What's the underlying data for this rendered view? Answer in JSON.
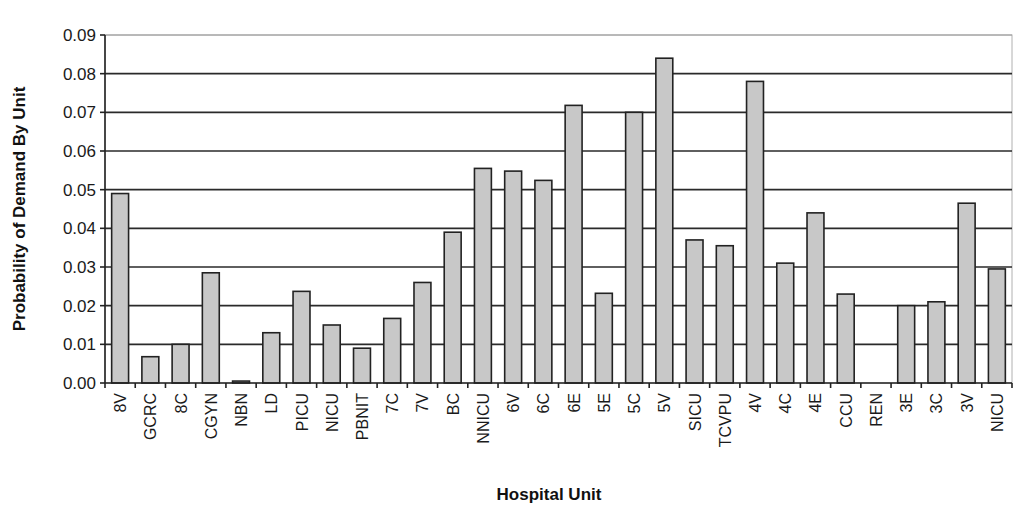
{
  "chart_data": {
    "type": "bar",
    "title": "",
    "xlabel": "Hospital Unit",
    "ylabel": "Probability of Demand By Unit",
    "ylim": [
      0,
      0.09
    ],
    "yticks": [
      "0.00",
      "0.01",
      "0.02",
      "0.03",
      "0.04",
      "0.05",
      "0.06",
      "0.07",
      "0.08",
      "0.09"
    ],
    "grid": true,
    "legend": null,
    "bar_color": "#c8c8c8",
    "categories": [
      "8V",
      "GCRC",
      "8C",
      "CGYN",
      "NBN",
      "LD",
      "PICU",
      "NICU",
      "PBNIT",
      "7C",
      "7V",
      "BC",
      "NNICU",
      "6V",
      "6C",
      "6E",
      "5E",
      "5C",
      "5V",
      "SICU",
      "TCVPU",
      "4V",
      "4C",
      "4E",
      "CCU",
      "REN",
      "3E",
      "3C",
      "3V",
      "NICU"
    ],
    "values": [
      0.049,
      0.0068,
      0.01,
      0.0285,
      0.0005,
      0.013,
      0.0237,
      0.015,
      0.009,
      0.0167,
      0.026,
      0.039,
      0.0555,
      0.0548,
      0.0524,
      0.0718,
      0.0232,
      0.07,
      0.084,
      0.037,
      0.0355,
      0.078,
      0.031,
      0.044,
      0.023,
      0.0,
      0.02,
      0.021,
      0.0465,
      0.0295
    ]
  }
}
